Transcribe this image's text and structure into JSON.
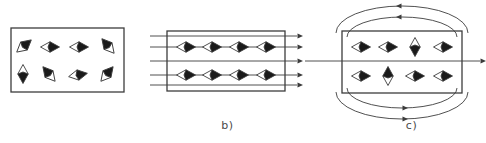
{
  "figure": {
    "background_color": "#ffffff",
    "stroke_color": "#3c3c3c",
    "domain_fill_dark": "#1a1a1a",
    "domain_fill_light": "#ffffff",
    "width": 486,
    "height": 143
  },
  "panels": [
    {
      "id": "a",
      "caption": "a)",
      "description": "unmagnetised material with randomly oriented magnetic domains",
      "body": {
        "x": 11,
        "y": 28,
        "width": 113,
        "height": 64
      },
      "field_lines": [],
      "domains": [
        {
          "cx": 24,
          "cy": 46,
          "angle": -40
        },
        {
          "cx": 50,
          "cy": 47,
          "angle": 0
        },
        {
          "cx": 79,
          "cy": 47,
          "angle": 0
        },
        {
          "cx": 108,
          "cy": 46,
          "angle": -130
        },
        {
          "cx": 23,
          "cy": 74,
          "angle": 90
        },
        {
          "cx": 49,
          "cy": 74,
          "angle": -130
        },
        {
          "cx": 78,
          "cy": 75,
          "angle": -10
        },
        {
          "cx": 107,
          "cy": 74,
          "angle": -50
        }
      ]
    },
    {
      "id": "b",
      "caption": "b)",
      "description": "domains aligned by an applied external magnetic field",
      "body": {
        "x": 17,
        "y": 31,
        "width": 118,
        "height": 60
      },
      "field_lines": [
        {
          "y": 36,
          "x1": 0,
          "x2": 153,
          "arrow": true
        },
        {
          "y": 47,
          "x1": 0,
          "x2": 153,
          "arrow": true
        },
        {
          "y": 61,
          "x1": 0,
          "x2": 153,
          "arrow": true
        },
        {
          "y": 75,
          "x1": 0,
          "x2": 153,
          "arrow": true
        },
        {
          "y": 85,
          "x1": 0,
          "x2": 153,
          "arrow": true
        }
      ],
      "domains": [
        {
          "cx": 36,
          "cy": 47,
          "angle": 0
        },
        {
          "cx": 62,
          "cy": 47,
          "angle": 0
        },
        {
          "cx": 89,
          "cy": 47,
          "angle": 0
        },
        {
          "cx": 116,
          "cy": 47,
          "angle": 0
        },
        {
          "cx": 36,
          "cy": 75,
          "angle": 0
        },
        {
          "cx": 62,
          "cy": 75,
          "angle": 0
        },
        {
          "cx": 89,
          "cy": 75,
          "angle": 0
        },
        {
          "cx": 116,
          "cy": 75,
          "angle": 0
        }
      ]
    },
    {
      "id": "c",
      "caption": "c)",
      "description": "permanent magnet with closed external field lines above and below",
      "body": {
        "x": 37,
        "y": 31,
        "width": 120,
        "height": 62
      },
      "field_lines": [
        {
          "y": 61,
          "x1": 0,
          "x2": 181,
          "arrow": true
        }
      ],
      "loops": [
        {
          "rx": 66,
          "ry": 27,
          "cx": 97,
          "cy": 33,
          "side": "top",
          "arrow_dir": "left"
        },
        {
          "rx": 55,
          "ry": 20,
          "cx": 97,
          "cy": 37,
          "side": "top",
          "arrow_dir": "left"
        },
        {
          "rx": 66,
          "ry": 27,
          "cx": 97,
          "cy": 92,
          "side": "bottom",
          "arrow_dir": "right"
        },
        {
          "rx": 55,
          "ry": 20,
          "cx": 97,
          "cy": 88,
          "side": "bottom",
          "arrow_dir": "right"
        }
      ],
      "domains": [
        {
          "cx": 56,
          "cy": 47,
          "angle": 0
        },
        {
          "cx": 83,
          "cy": 47,
          "angle": 0
        },
        {
          "cx": 110,
          "cy": 47,
          "angle": 90
        },
        {
          "cx": 138,
          "cy": 47,
          "angle": 0
        },
        {
          "cx": 56,
          "cy": 76,
          "angle": 0
        },
        {
          "cx": 83,
          "cy": 76,
          "angle": 270
        },
        {
          "cx": 110,
          "cy": 76,
          "angle": 0
        },
        {
          "cx": 138,
          "cy": 76,
          "angle": 0
        }
      ]
    }
  ]
}
